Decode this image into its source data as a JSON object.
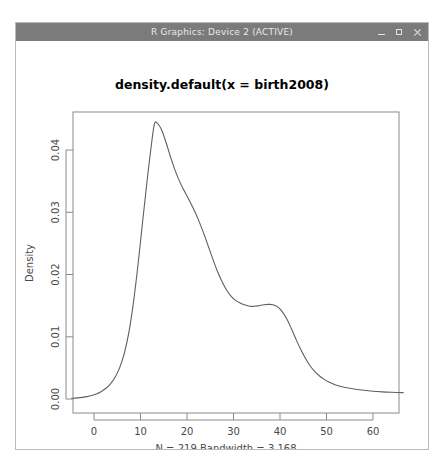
{
  "window": {
    "title": "R Graphics: Device 2 (ACTIVE)",
    "controls": {
      "minimize": "minimize",
      "maximize": "maximize",
      "close": "close"
    }
  },
  "chart_data": {
    "type": "line",
    "title": "density.default(x = birth2008)",
    "xlabel": "N = 219   Bandwidth = 3.168",
    "ylabel": "Density",
    "xlim": [
      -4.8,
      66.5
    ],
    "ylim": [
      -0.0016,
      0.0465
    ],
    "xticks": [
      0,
      10,
      20,
      30,
      40,
      50,
      60
    ],
    "xtick_labels": [
      "0",
      "10",
      "20",
      "30",
      "40",
      "50",
      "60"
    ],
    "yticks": [
      0.0,
      0.01,
      0.02,
      0.03,
      0.04
    ],
    "ytick_labels": [
      "0.00",
      "0.01",
      "0.02",
      "0.03",
      "0.04"
    ],
    "grid": false,
    "legend": null,
    "n": 219,
    "bandwidth": 3.168,
    "series": [
      {
        "name": "density",
        "x": [
          -4.8,
          -3.5,
          -2.5,
          -1.5,
          -0.5,
          0.5,
          1.5,
          2.5,
          3.5,
          4.5,
          5.5,
          6.5,
          7.5,
          8.5,
          9.5,
          10.5,
          11.5,
          12.5,
          13.0,
          13.5,
          14.5,
          15.5,
          16.5,
          17.5,
          18.5,
          19.5,
          20.5,
          21.5,
          22.5,
          23.5,
          24.5,
          25.5,
          26.5,
          27.5,
          28.5,
          29.5,
          30.5,
          31.5,
          32.5,
          33.5,
          34.5,
          35.5,
          36.5,
          37.5,
          38.5,
          39.5,
          40.5,
          41.5,
          42.5,
          43.5,
          44.5,
          45.5,
          46.5,
          47.5,
          48.5,
          49.5,
          50.5,
          52.0,
          54.0,
          56.0,
          58.0,
          60.0,
          62.0,
          64.0,
          66.5
        ],
        "values": [
          0.00012,
          0.00018,
          0.00026,
          0.00038,
          0.00056,
          0.00082,
          0.00118,
          0.00168,
          0.0024,
          0.00345,
          0.005,
          0.0073,
          0.0107,
          0.0156,
          0.0218,
          0.0288,
          0.0356,
          0.0418,
          0.0442,
          0.0444,
          0.0433,
          0.0412,
          0.0388,
          0.0366,
          0.0348,
          0.0333,
          0.0319,
          0.0304,
          0.0287,
          0.0268,
          0.0247,
          0.0226,
          0.0206,
          0.0189,
          0.0175,
          0.0165,
          0.0158,
          0.0154,
          0.0151,
          0.0149,
          0.0149,
          0.015,
          0.01515,
          0.0152,
          0.01515,
          0.0148,
          0.014,
          0.0128,
          0.0112,
          0.0095,
          0.0079,
          0.0065,
          0.0053,
          0.0044,
          0.0037,
          0.00315,
          0.00275,
          0.00225,
          0.00185,
          0.0016,
          0.0014,
          0.00125,
          0.00115,
          0.00108,
          0.00102
        ]
      }
    ]
  }
}
